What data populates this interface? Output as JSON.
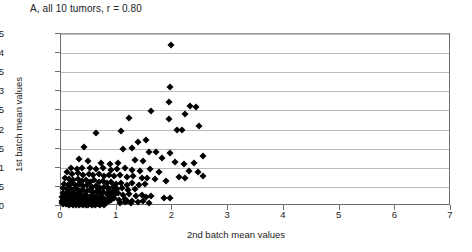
{
  "chart_data": {
    "type": "scatter",
    "title": "A, all 10 tumors, r = 0.80",
    "xlabel": "2nd batch mean values",
    "ylabel": "1st batch mean values",
    "xlim": [
      0,
      7
    ],
    "ylim": [
      0,
      4.5
    ],
    "xticks": [
      0,
      1,
      2,
      3,
      4,
      5,
      6,
      7
    ],
    "xtick_labels": [
      "0",
      "1",
      "2",
      "3",
      "4",
      "5",
      "6",
      "7"
    ],
    "yticks": [
      0,
      0.5,
      1,
      1.5,
      2,
      2.5,
      3,
      3.5,
      4,
      4.5
    ],
    "ytick_labels": [
      "0",
      "0.5",
      "1",
      "1.5",
      "2",
      "2.5",
      "3",
      "3.5",
      "4",
      "4.5"
    ],
    "grid": "horizontal",
    "legend": "none",
    "correlation_r": 0.8,
    "n_tumors": 10,
    "marker": "diamond",
    "marker_color": "#000000",
    "points": [
      [
        1.98,
        4.2
      ],
      [
        1.95,
        3.12
      ],
      [
        1.93,
        2.72
      ],
      [
        2.32,
        2.62
      ],
      [
        2.42,
        2.58
      ],
      [
        1.62,
        2.48
      ],
      [
        2.22,
        2.4
      ],
      [
        1.22,
        2.3
      ],
      [
        1.93,
        2.28
      ],
      [
        2.48,
        2.1
      ],
      [
        2.08,
        2.0
      ],
      [
        2.18,
        1.99
      ],
      [
        1.08,
        1.95
      ],
      [
        0.62,
        1.92
      ],
      [
        1.52,
        1.72
      ],
      [
        1.38,
        1.68
      ],
      [
        0.42,
        1.55
      ],
      [
        1.28,
        1.52
      ],
      [
        1.12,
        1.48
      ],
      [
        2.55,
        1.32
      ],
      [
        1.7,
        1.4
      ],
      [
        1.58,
        1.42
      ],
      [
        1.95,
        1.38
      ],
      [
        0.33,
        1.22
      ],
      [
        0.48,
        1.18
      ],
      [
        0.72,
        1.12
      ],
      [
        0.88,
        1.1
      ],
      [
        1.02,
        1.12
      ],
      [
        1.32,
        1.2
      ],
      [
        1.48,
        1.18
      ],
      [
        1.82,
        1.25
      ],
      [
        2.05,
        1.15
      ],
      [
        2.2,
        1.1
      ],
      [
        2.38,
        1.12
      ],
      [
        0.18,
        1.0
      ],
      [
        0.28,
        0.98
      ],
      [
        0.38,
        0.99
      ],
      [
        0.52,
        1.0
      ],
      [
        0.62,
        0.97
      ],
      [
        0.75,
        1.0
      ],
      [
        0.9,
        0.95
      ],
      [
        1.0,
        0.98
      ],
      [
        1.15,
        1.0
      ],
      [
        1.28,
        0.95
      ],
      [
        1.42,
        0.92
      ],
      [
        1.6,
        0.96
      ],
      [
        1.75,
        0.9
      ],
      [
        2.3,
        0.92
      ],
      [
        2.45,
        0.88
      ],
      [
        2.55,
        0.78
      ],
      [
        2.12,
        0.75
      ],
      [
        2.22,
        0.74
      ],
      [
        0.1,
        0.88
      ],
      [
        0.2,
        0.85
      ],
      [
        0.3,
        0.86
      ],
      [
        0.4,
        0.82
      ],
      [
        0.5,
        0.84
      ],
      [
        0.58,
        0.8
      ],
      [
        0.68,
        0.83
      ],
      [
        0.78,
        0.79
      ],
      [
        0.86,
        0.82
      ],
      [
        0.95,
        0.78
      ],
      [
        1.05,
        0.8
      ],
      [
        1.18,
        0.76
      ],
      [
        1.3,
        0.78
      ],
      [
        1.45,
        0.74
      ],
      [
        1.55,
        0.72
      ],
      [
        1.68,
        0.7
      ],
      [
        1.88,
        0.66
      ],
      [
        0.08,
        0.72
      ],
      [
        0.15,
        0.7
      ],
      [
        0.22,
        0.68
      ],
      [
        0.3,
        0.71
      ],
      [
        0.38,
        0.66
      ],
      [
        0.45,
        0.69
      ],
      [
        0.52,
        0.64
      ],
      [
        0.6,
        0.67
      ],
      [
        0.68,
        0.62
      ],
      [
        0.75,
        0.65
      ],
      [
        0.82,
        0.6
      ],
      [
        0.9,
        0.63
      ],
      [
        0.98,
        0.58
      ],
      [
        1.08,
        0.61
      ],
      [
        1.18,
        0.56
      ],
      [
        1.28,
        0.59
      ],
      [
        1.4,
        0.54
      ],
      [
        1.5,
        0.57
      ],
      [
        0.05,
        0.58
      ],
      [
        0.12,
        0.56
      ],
      [
        0.18,
        0.6
      ],
      [
        0.25,
        0.54
      ],
      [
        0.32,
        0.57
      ],
      [
        0.4,
        0.52
      ],
      [
        0.47,
        0.55
      ],
      [
        0.55,
        0.5
      ],
      [
        0.62,
        0.53
      ],
      [
        0.7,
        0.48
      ],
      [
        0.78,
        0.51
      ],
      [
        0.85,
        0.46
      ],
      [
        0.93,
        0.49
      ],
      [
        1.0,
        0.44
      ],
      [
        1.1,
        0.47
      ],
      [
        1.2,
        0.42
      ],
      [
        1.32,
        0.45
      ],
      [
        0.04,
        0.46
      ],
      [
        0.1,
        0.44
      ],
      [
        0.16,
        0.48
      ],
      [
        0.22,
        0.42
      ],
      [
        0.28,
        0.45
      ],
      [
        0.34,
        0.4
      ],
      [
        0.4,
        0.43
      ],
      [
        0.46,
        0.38
      ],
      [
        0.52,
        0.41
      ],
      [
        0.58,
        0.36
      ],
      [
        0.64,
        0.39
      ],
      [
        0.7,
        0.34
      ],
      [
        0.76,
        0.37
      ],
      [
        0.82,
        0.32
      ],
      [
        0.88,
        0.35
      ],
      [
        0.95,
        0.3
      ],
      [
        1.02,
        0.33
      ],
      [
        1.12,
        0.28
      ],
      [
        1.22,
        0.31
      ],
      [
        1.35,
        0.26
      ],
      [
        1.46,
        0.29
      ],
      [
        1.52,
        0.24
      ],
      [
        1.62,
        0.27
      ],
      [
        0.03,
        0.34
      ],
      [
        0.08,
        0.32
      ],
      [
        0.13,
        0.36
      ],
      [
        0.18,
        0.3
      ],
      [
        0.23,
        0.33
      ],
      [
        0.28,
        0.28
      ],
      [
        0.33,
        0.31
      ],
      [
        0.38,
        0.26
      ],
      [
        0.43,
        0.29
      ],
      [
        0.48,
        0.24
      ],
      [
        0.53,
        0.27
      ],
      [
        0.58,
        0.22
      ],
      [
        0.63,
        0.25
      ],
      [
        0.68,
        0.2
      ],
      [
        0.73,
        0.23
      ],
      [
        0.78,
        0.19
      ],
      [
        0.84,
        0.22
      ],
      [
        0.9,
        0.17
      ],
      [
        0.96,
        0.2
      ],
      [
        1.04,
        0.16
      ],
      [
        1.14,
        0.19
      ],
      [
        0.02,
        0.24
      ],
      [
        0.06,
        0.22
      ],
      [
        0.1,
        0.26
      ],
      [
        0.14,
        0.2
      ],
      [
        0.18,
        0.23
      ],
      [
        0.22,
        0.18
      ],
      [
        0.26,
        0.21
      ],
      [
        0.3,
        0.16
      ],
      [
        0.34,
        0.19
      ],
      [
        0.38,
        0.15
      ],
      [
        0.42,
        0.18
      ],
      [
        0.46,
        0.13
      ],
      [
        0.5,
        0.16
      ],
      [
        0.54,
        0.12
      ],
      [
        0.58,
        0.15
      ],
      [
        0.62,
        0.11
      ],
      [
        0.66,
        0.14
      ],
      [
        0.7,
        0.1
      ],
      [
        0.74,
        0.13
      ],
      [
        0.8,
        0.09
      ],
      [
        0.86,
        0.12
      ],
      [
        0.02,
        0.14
      ],
      [
        0.05,
        0.12
      ],
      [
        0.08,
        0.16
      ],
      [
        0.11,
        0.1
      ],
      [
        0.14,
        0.13
      ],
      [
        0.17,
        0.09
      ],
      [
        0.2,
        0.12
      ],
      [
        0.23,
        0.08
      ],
      [
        0.26,
        0.11
      ],
      [
        0.29,
        0.07
      ],
      [
        0.32,
        0.1
      ],
      [
        0.35,
        0.06
      ],
      [
        0.38,
        0.09
      ],
      [
        0.41,
        0.05
      ],
      [
        0.44,
        0.08
      ],
      [
        0.47,
        0.05
      ],
      [
        0.5,
        0.07
      ],
      [
        0.54,
        0.04
      ],
      [
        0.58,
        0.06
      ],
      [
        0.62,
        0.04
      ],
      [
        0.66,
        0.06
      ],
      [
        0.01,
        0.07
      ],
      [
        0.03,
        0.05
      ],
      [
        0.06,
        0.08
      ],
      [
        0.09,
        0.04
      ],
      [
        0.12,
        0.06
      ],
      [
        0.15,
        0.03
      ],
      [
        0.18,
        0.05
      ],
      [
        0.21,
        0.03
      ],
      [
        0.24,
        0.05
      ],
      [
        0.27,
        0.02
      ],
      [
        0.3,
        0.04
      ],
      [
        0.33,
        0.02
      ],
      [
        0.36,
        0.04
      ],
      [
        0.4,
        0.02
      ],
      [
        0.44,
        0.03
      ],
      [
        0.49,
        0.02
      ],
      [
        0.55,
        0.03
      ],
      [
        0.61,
        0.02
      ],
      [
        0.7,
        0.03
      ],
      [
        0.78,
        0.02
      ],
      [
        1.05,
        0.08
      ],
      [
        1.15,
        0.1
      ],
      [
        1.25,
        0.07
      ],
      [
        1.18,
        0.12
      ],
      [
        1.28,
        0.14
      ],
      [
        1.38,
        0.11
      ],
      [
        1.48,
        0.13
      ],
      [
        1.58,
        0.09
      ],
      [
        1.85,
        0.22
      ],
      [
        1.95,
        0.2
      ],
      [
        0.92,
        0.26
      ],
      [
        0.86,
        0.42
      ],
      [
        0.96,
        0.38
      ]
    ]
  }
}
